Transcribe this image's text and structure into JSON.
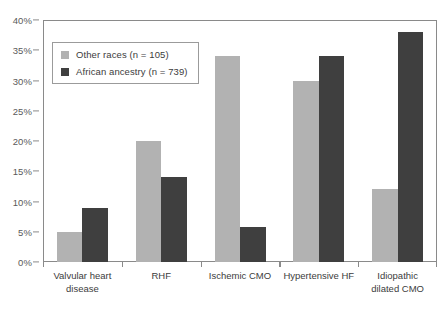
{
  "chart_data": {
    "type": "bar",
    "title": "",
    "xlabel": "",
    "ylabel": "",
    "ylim": [
      0,
      40
    ],
    "ytick_step": 5,
    "ytick_labels": [
      "0%",
      "5%",
      "10%",
      "15%",
      "20%",
      "25%",
      "30%",
      "35%",
      "40%"
    ],
    "grid": true,
    "legend_position": "upper-left-inside",
    "categories": [
      "Valvular heart\ndisease",
      "RHF",
      "Ischemic CMO",
      "Hypertensive HF",
      "Idiopathic\ndilated CMO"
    ],
    "series": [
      {
        "name": "Other races (n = 105)",
        "color": "#b2b2b2",
        "values": [
          5,
          20,
          34,
          30,
          12
        ]
      },
      {
        "name": "African ancestry (n = 739)",
        "color": "#3f3f3f",
        "values": [
          9,
          14,
          5.8,
          34,
          38
        ]
      }
    ]
  },
  "legend": {
    "items": [
      {
        "label": "Other races (n = 105)",
        "swatch": "light"
      },
      {
        "label": "African ancestry (n = 739)",
        "swatch": "dark"
      }
    ]
  },
  "colors": {
    "series_light": "#b2b2b2",
    "series_dark": "#3f3f3f",
    "axis": "#8a8a8a",
    "gridline": "#d8d8d8",
    "text": "#3c3c3c",
    "tick_text": "#5a5a5a",
    "background": "#ffffff"
  }
}
